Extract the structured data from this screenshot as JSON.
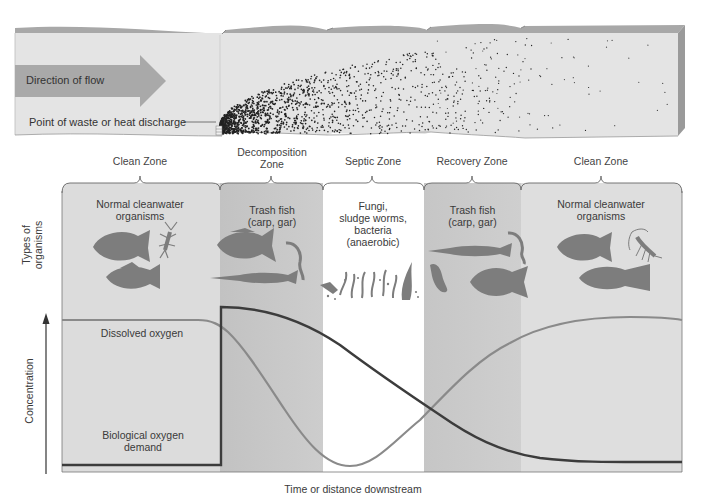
{
  "river": {
    "flow_label": "Direction of flow",
    "discharge_label": "Point of waste or heat discharge"
  },
  "zones": [
    {
      "name": "Clean Zone",
      "organisms": "Normal cleanwater organisms",
      "organisms_line1": "Normal cleanwater",
      "organisms_line2": "organisms"
    },
    {
      "name": "Decomposition Zone",
      "name_line1": "Decomposition",
      "name_line2": "Zone",
      "organisms": "Trash fish (carp, gar)",
      "organisms_line1": "Trash fish",
      "organisms_line2": "(carp, gar)"
    },
    {
      "name": "Septic Zone",
      "organisms": "Fungi, sludge worms, bacteria (anaerobic)",
      "organisms_line1": "Fungi,",
      "organisms_line2": "sludge worms,",
      "organisms_line3": "bacteria",
      "organisms_line4": "(anaerobic)"
    },
    {
      "name": "Recovery Zone",
      "organisms": "Trash fish (carp, gar)",
      "organisms_line1": "Trash fish",
      "organisms_line2": "(carp, gar)"
    },
    {
      "name": "Clean Zone",
      "organisms": "Normal cleanwater organisms",
      "organisms_line1": "Normal cleanwater",
      "organisms_line2": "organisms"
    }
  ],
  "axes": {
    "organisms_label_line1": "Types of",
    "organisms_label_line2": "organisms",
    "y_label": "Concentration",
    "x_label": "Time or distance downstream"
  },
  "curves": {
    "dissolved_oxygen_label": "Dissolved oxygen",
    "bod_label_line1": "Biological oxygen",
    "bod_label_line2": "demand"
  },
  "colors": {
    "clean_zone": "#dcdcdc",
    "decomposition_zone": "#c4c4c4",
    "septic_zone": "#ffffff",
    "recovery_zone": "#c8c8c8",
    "arrow": "#a9a9a9",
    "organism_silhouette": "#7d7d7d",
    "do_curve": "#8a8a8a",
    "bod_curve": "#3c3c3c"
  },
  "chart_data": {
    "type": "line",
    "title": "",
    "xlabel": "Time or distance downstream",
    "ylabel": "Concentration",
    "x_categories": [
      "Clean Zone",
      "Decomposition Zone",
      "Septic Zone",
      "Recovery Zone",
      "Clean Zone"
    ],
    "series": [
      {
        "name": "Dissolved oxygen",
        "trend": "high and flat in clean zone, declines through decomposition zone, minimum in septic zone, rises through recovery zone back to high in clean zone",
        "values_relative": [
          0.93,
          0.93,
          0.7,
          0.25,
          0.02,
          0.3,
          0.7,
          0.93,
          0.92
        ]
      },
      {
        "name": "Biological oxygen demand",
        "trend": "low in clean zone, jumps sharply at discharge point, declines gradually through septic and recovery zones to low in clean zone",
        "values_relative": [
          0.03,
          0.03,
          1.0,
          0.9,
          0.55,
          0.3,
          0.12,
          0.05,
          0.05
        ]
      }
    ]
  }
}
